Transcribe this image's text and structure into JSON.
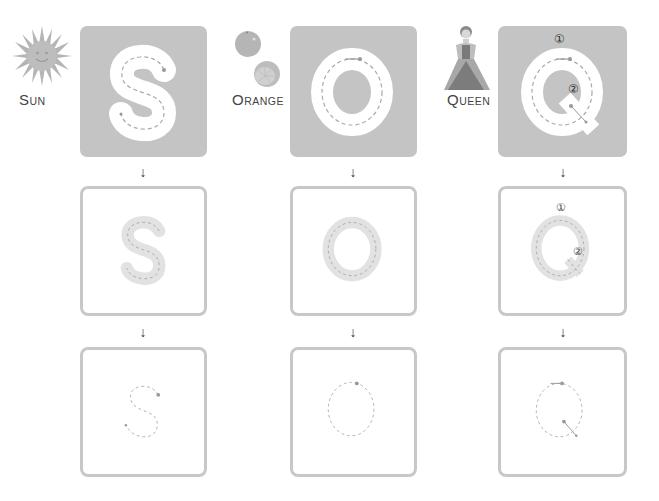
{
  "columns": [
    {
      "letter": "S",
      "word_cap": "S",
      "word_rest": "UN",
      "picture": "sun-icon",
      "stroke_numbers": []
    },
    {
      "letter": "O",
      "word_cap": "O",
      "word_rest": "RANGE",
      "picture": "orange-icon",
      "stroke_numbers": []
    },
    {
      "letter": "Q",
      "word_cap": "Q",
      "word_rest": "UEEN",
      "picture": "queen-icon",
      "stroke_numbers": [
        "①",
        "②"
      ]
    }
  ],
  "arrow_glyph": "↓",
  "colors": {
    "filled_box": "#c4c4c4",
    "outline_box": "#c8c8c8",
    "letter_white": "#ffffff",
    "dash": "#aaaaaa",
    "dot": "#999999"
  }
}
